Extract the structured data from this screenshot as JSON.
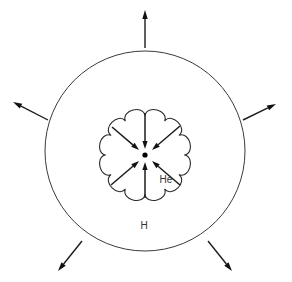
{
  "figure": {
    "type": "schematic-diagram",
    "background_color": "#ffffff",
    "line_color": "#2b2b2b",
    "width": 292,
    "height": 282
  },
  "labels": {
    "outer_shell": "H",
    "inner_core": "He"
  },
  "geometry": {
    "outer_circle": {
      "cx": 145,
      "cy": 151,
      "r": 100
    },
    "inner_cloud": {
      "cx": 145,
      "cy": 155,
      "r": 42,
      "lobes": 12,
      "bump": 4.5
    },
    "center_dot": {
      "cx": 145,
      "cy": 155,
      "r": 2.6
    },
    "outer_label_pos": {
      "x": 144,
      "y": 226
    },
    "inner_label_pos": {
      "x": 166,
      "y": 180
    }
  },
  "inward_arrows": [
    {
      "name": "inward-arrow-top",
      "x1": 145,
      "y1": 113,
      "x2": 145,
      "y2": 149
    },
    {
      "name": "inward-arrow-upper-left",
      "x1": 112,
      "y1": 127,
      "x2": 139,
      "y2": 150
    },
    {
      "name": "inward-arrow-upper-right",
      "x1": 180,
      "y1": 126,
      "x2": 152,
      "y2": 150
    },
    {
      "name": "inward-arrow-lower-left",
      "x1": 111,
      "y1": 185,
      "x2": 139,
      "y2": 161
    },
    {
      "name": "inward-arrow-lower-right",
      "x1": 180,
      "y1": 185,
      "x2": 152,
      "y2": 161
    },
    {
      "name": "inward-arrow-bottom",
      "x1": 145,
      "y1": 198,
      "x2": 145,
      "y2": 162
    }
  ],
  "outward_arrows": [
    {
      "name": "outward-arrow-top",
      "x1": 145,
      "y1": 48,
      "x2": 145,
      "y2": 10
    },
    {
      "name": "outward-arrow-upper-left",
      "x1": 48,
      "y1": 120,
      "x2": 13,
      "y2": 102
    },
    {
      "name": "outward-arrow-upper-right",
      "x1": 243,
      "y1": 120,
      "x2": 276,
      "y2": 104
    },
    {
      "name": "outward-arrow-lower-left",
      "x1": 82,
      "y1": 241,
      "x2": 58,
      "y2": 271
    },
    {
      "name": "outward-arrow-lower-right",
      "x1": 208,
      "y1": 241,
      "x2": 232,
      "y2": 271
    }
  ]
}
